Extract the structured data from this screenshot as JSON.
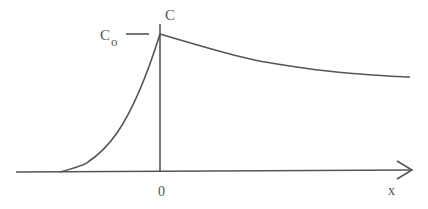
{
  "diagram": {
    "labels": {
      "y_axis": "C",
      "peak": "C",
      "peak_subscript": "o",
      "origin": "0",
      "x_axis": "x"
    },
    "colors": {
      "line": "#555555",
      "background": "#ffffff"
    }
  }
}
